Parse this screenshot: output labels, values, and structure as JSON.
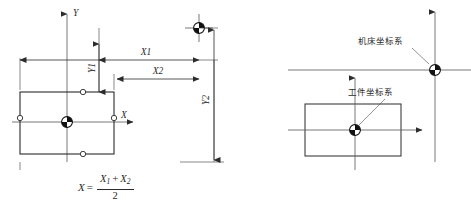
{
  "figure": {
    "title": "",
    "panels": [
      {
        "id": "left",
        "axis_labels": {
          "x": "X",
          "y": "Y"
        },
        "dimensions": [
          {
            "name": "X1",
            "label": "X1",
            "orientation": "horizontal"
          },
          {
            "name": "X2",
            "label": "X2",
            "orientation": "horizontal"
          },
          {
            "name": "Y1",
            "label": "Y1",
            "orientation": "vertical"
          },
          {
            "name": "Y2",
            "label": "Y2",
            "orientation": "vertical"
          }
        ],
        "formula": {
          "lhs": "X",
          "equals": "=",
          "numerator_first": "X",
          "numerator_first_sub": "1",
          "numerator_plus": "+",
          "numerator_second": "X",
          "numerator_second_sub": "2",
          "denominator": "2"
        }
      },
      {
        "id": "right",
        "annotations": [
          {
            "name": "machine-coordinate-system",
            "label": "机床坐标系"
          },
          {
            "name": "workpiece-coordinate-system",
            "label": "工件坐标系"
          }
        ],
        "formula": {
          "lhs": "Y",
          "equals": "=",
          "numerator_first": "Y",
          "numerator_first_sub": "1",
          "numerator_plus": "+",
          "numerator_second": "Y",
          "numerator_second_sub": "2",
          "denominator": "2"
        }
      }
    ],
    "colors": {
      "line": "#2b2b2b",
      "thin_line": "#3a3a3a",
      "background": "#ffffff",
      "datum_fill": "#111111"
    }
  }
}
